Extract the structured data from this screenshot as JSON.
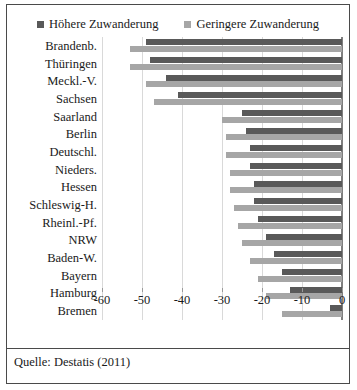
{
  "figure": {
    "source_note": "Quelle: Destatis (2011)"
  },
  "legend": {
    "position": "top-center",
    "items": [
      {
        "label": "Höhere Zuwanderung",
        "color": "#595959",
        "icon": "square-marker-icon"
      },
      {
        "label": "Geringere Zuwanderung",
        "color": "#a6a6a6",
        "icon": "square-marker-icon"
      }
    ]
  },
  "chart_data": {
    "type": "bar",
    "orientation": "horizontal",
    "title": "",
    "xlabel": "",
    "ylabel": "",
    "xlim": [
      -60,
      0
    ],
    "xticks": [
      -60,
      -50,
      -40,
      -30,
      -20,
      -10,
      0
    ],
    "xtick_labels": [
      "-60",
      "-50",
      "-40",
      "-30",
      "-20",
      "-10",
      "0"
    ],
    "grid": true,
    "categories": [
      "Brandenb.",
      "Thüringen",
      "Meckl.-V.",
      "Sachsen",
      "Saarland",
      "Berlin",
      "Deutschl.",
      "Nieders.",
      "Hessen",
      "Schleswig-H.",
      "Rheinl.-Pf.",
      "NRW",
      "Baden-W.",
      "Bayern",
      "Hamburg",
      "Bremen"
    ],
    "series": [
      {
        "name": "Höhere Zuwanderung",
        "color": "#595959",
        "values": [
          -49,
          -48,
          -44,
          -41,
          -25,
          -24,
          -23,
          -23,
          -22,
          -22,
          -21,
          -19,
          -17,
          -15,
          -13,
          -3
        ]
      },
      {
        "name": "Geringere Zuwanderung",
        "color": "#a6a6a6",
        "values": [
          -53,
          -53,
          -49,
          -47,
          -30,
          -29,
          -29,
          -28,
          -28,
          -27,
          -26,
          -25,
          -23,
          -21,
          -19,
          -15
        ]
      }
    ]
  }
}
